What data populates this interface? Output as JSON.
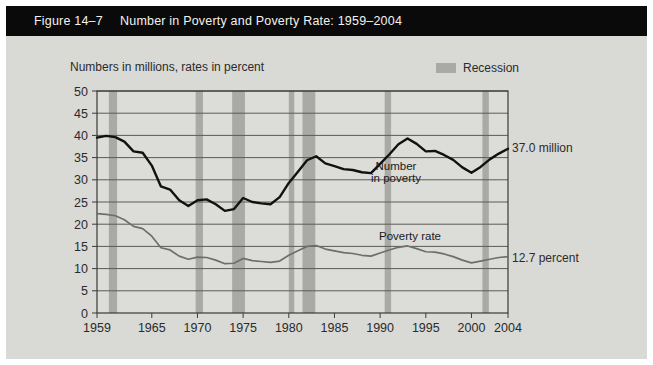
{
  "header": {
    "figure_number": "Figure 14–7",
    "title": "Number in Poverty and Poverty Rate: 1959–2004"
  },
  "subtitle": "Numbers in millions, rates in percent",
  "legend": {
    "recession_label": "Recession",
    "recession_color": "#a9a9a6"
  },
  "annotations": {
    "number_in_poverty_line1": "Number",
    "number_in_poverty_line2": "in poverty",
    "poverty_rate": "Poverty rate",
    "end_value_number": "37.0 million",
    "end_value_rate": "12.7 percent"
  },
  "chart_data": {
    "type": "line",
    "title": "Number in Poverty and Poverty Rate: 1959–2004",
    "subtitle": "Numbers in millions, rates in percent",
    "xlabel": "",
    "ylabel": "",
    "xlim": [
      1959,
      2004
    ],
    "ylim": [
      0,
      50
    ],
    "ytick_step": 5,
    "yticks": [
      0,
      5,
      10,
      15,
      20,
      25,
      30,
      35,
      40,
      45,
      50
    ],
    "xticks": [
      1959,
      1965,
      1970,
      1975,
      1980,
      1985,
      1990,
      1995,
      2000,
      2004
    ],
    "grid": true,
    "legend_position": "top-right",
    "x": [
      1959,
      1960,
      1961,
      1962,
      1963,
      1964,
      1965,
      1966,
      1967,
      1968,
      1969,
      1970,
      1971,
      1972,
      1973,
      1974,
      1975,
      1976,
      1977,
      1978,
      1979,
      1980,
      1981,
      1982,
      1983,
      1984,
      1985,
      1986,
      1987,
      1988,
      1989,
      1990,
      1991,
      1992,
      1993,
      1994,
      1995,
      1996,
      1997,
      1998,
      1999,
      2000,
      2001,
      2002,
      2003,
      2004
    ],
    "series": [
      {
        "name": "Number in poverty",
        "unit": "millions",
        "color": "#111111",
        "values": [
          39.5,
          39.9,
          39.6,
          38.6,
          36.4,
          36.1,
          33.2,
          28.5,
          27.8,
          25.4,
          24.1,
          25.4,
          25.6,
          24.5,
          23.0,
          23.4,
          25.9,
          25.0,
          24.7,
          24.5,
          26.1,
          29.3,
          31.8,
          34.4,
          35.3,
          33.7,
          33.1,
          32.4,
          32.2,
          31.7,
          31.5,
          33.6,
          35.7,
          38.0,
          39.3,
          38.1,
          36.4,
          36.5,
          35.6,
          34.5,
          32.8,
          31.6,
          32.9,
          34.6,
          35.9,
          37.0
        ],
        "end_value": 37.0,
        "end_label": "37.0 million"
      },
      {
        "name": "Poverty rate",
        "unit": "percent",
        "color": "#6e6e6e",
        "values": [
          22.4,
          22.2,
          21.9,
          21.0,
          19.5,
          19.0,
          17.3,
          14.7,
          14.2,
          12.8,
          12.1,
          12.6,
          12.5,
          11.9,
          11.1,
          11.2,
          12.3,
          11.8,
          11.6,
          11.4,
          11.7,
          13.0,
          14.0,
          15.0,
          15.2,
          14.4,
          14.0,
          13.6,
          13.4,
          13.0,
          12.8,
          13.5,
          14.2,
          14.8,
          15.1,
          14.5,
          13.8,
          13.7,
          13.3,
          12.7,
          11.9,
          11.3,
          11.7,
          12.1,
          12.5,
          12.7
        ],
        "end_value": 12.7,
        "end_label": "12.7 percent"
      }
    ],
    "recession_bands": [
      {
        "start": 1960.3,
        "end": 1961.2
      },
      {
        "start": 1969.8,
        "end": 1970.6
      },
      {
        "start": 1973.8,
        "end": 1975.2
      },
      {
        "start": 1980.0,
        "end": 1980.6
      },
      {
        "start": 1981.5,
        "end": 1982.9
      },
      {
        "start": 1990.5,
        "end": 1991.2
      },
      {
        "start": 2001.2,
        "end": 2001.9
      }
    ]
  }
}
